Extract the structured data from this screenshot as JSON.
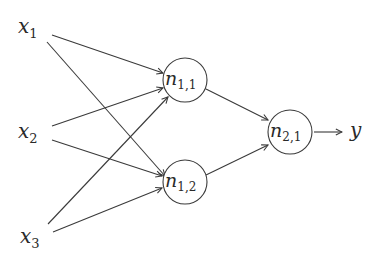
{
  "diagram": {
    "type": "neural-network",
    "inputs": [
      {
        "id": "x1",
        "base": "x",
        "sub": "1"
      },
      {
        "id": "x2",
        "base": "x",
        "sub": "2"
      },
      {
        "id": "x3",
        "base": "x",
        "sub": "3"
      }
    ],
    "hidden_nodes": [
      {
        "id": "n11",
        "base": "n",
        "sub": "1,1"
      },
      {
        "id": "n12",
        "base": "n",
        "sub": "1,2"
      }
    ],
    "output_node": {
      "id": "n21",
      "base": "n",
      "sub": "2,1"
    },
    "output": {
      "id": "y",
      "label": "y"
    },
    "edges": [
      [
        "x1",
        "n11"
      ],
      [
        "x1",
        "n12"
      ],
      [
        "x2",
        "n11"
      ],
      [
        "x2",
        "n12"
      ],
      [
        "x3",
        "n11"
      ],
      [
        "x3",
        "n12"
      ],
      [
        "n11",
        "n21"
      ],
      [
        "n12",
        "n21"
      ],
      [
        "n21",
        "y"
      ]
    ],
    "stroke_color": "#3a3a3a"
  }
}
